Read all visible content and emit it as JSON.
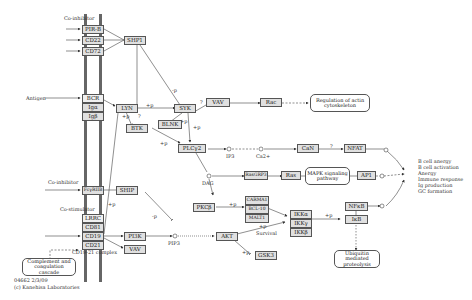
{
  "diagram": {
    "type": "KEGG pathway",
    "labels": {
      "co_inhibitor_top": "Co-inhibitor",
      "antigen": "Antigen",
      "co_inhibitor_mid": "Co-inhibitor",
      "co_stimulator": "Co-stimulator",
      "cd19_21_complex": "CD19-21 complex",
      "ip3": "IP3",
      "ca2": "Ca2+",
      "dag": "DAG",
      "pip3": "PIP3",
      "survival": "Survival",
      "copyright_id": "04662  2/3/09",
      "copyright": "(c) Kanehisa Laboratories"
    },
    "nodes": {
      "pirb": "PIR-B",
      "cd22": "CD22",
      "cd72": "CD72",
      "ship1": "SHP1",
      "bcr": "BCR",
      "iga": "Igα",
      "igb": "Igβ",
      "lyn": "LYN",
      "syk": "SYK",
      "btk": "BTK",
      "blnk": "BLNK",
      "plcg2": "PLCγ2",
      "vav_top": "VAV",
      "rac": "Rac",
      "can": "CaN",
      "nfat": "NFAT",
      "rasgrp3": "RasGRP3",
      "ras": "Ras",
      "ap1": "AP1",
      "fcgriib": "FcγRIIB",
      "ship": "SHIP",
      "lrrc": "LRRC",
      "cd81": "CD81",
      "cd19": "CD19",
      "cd21": "CD21",
      "pi3k": "PI3K",
      "vav_bottom": "VAV",
      "pkcb": "PKCβ",
      "carma1": "CARMA1",
      "bcl10": "BCL-10",
      "malt1": "MALT1",
      "akt": "AKT",
      "gsk3": "GSK3",
      "ikka": "IKKα",
      "ikkg": "IKKγ",
      "ikkb": "IKKβ",
      "nfkb": "NFκB",
      "ikb": "IκB"
    },
    "maps": {
      "actin": "Regulation of actin cytoskeleton",
      "mapk": "MAPK signaling pathway",
      "ubiquitin": "Ubiquitin mediated proteolysis",
      "complement": "Complement and coagulation cascade"
    },
    "outcome": [
      "B cell anergy",
      "B cell activation",
      "Anergy",
      "Immune response",
      "Ig production",
      "GC formation"
    ],
    "edge_labels": {
      "p": "+p",
      "dp": "-p",
      "q": "?"
    }
  }
}
